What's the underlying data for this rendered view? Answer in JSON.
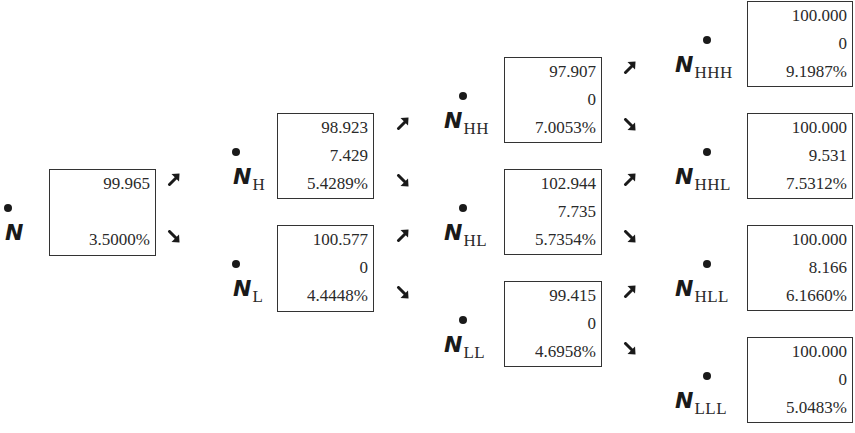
{
  "diagram": {
    "type": "binomial-tree",
    "nodes": [
      {
        "id": "N",
        "symbol": "N",
        "subscript": "",
        "lines": [
          "99.965",
          "",
          "3.5000%"
        ]
      },
      {
        "id": "NH",
        "symbol": "N",
        "subscript": "H",
        "lines": [
          "98.923",
          "7.429",
          "5.4289%"
        ]
      },
      {
        "id": "NL",
        "symbol": "N",
        "subscript": "L",
        "lines": [
          "100.577",
          "0",
          "4.4448%"
        ]
      },
      {
        "id": "NHH",
        "symbol": "N",
        "subscript": "HH",
        "lines": [
          "97.907",
          "0",
          "7.0053%"
        ]
      },
      {
        "id": "NHL",
        "symbol": "N",
        "subscript": "HL",
        "lines": [
          "102.944",
          "7.735",
          "5.7354%"
        ]
      },
      {
        "id": "NLL",
        "symbol": "N",
        "subscript": "LL",
        "lines": [
          "99.415",
          "0",
          "4.6958%"
        ]
      },
      {
        "id": "NHHH",
        "symbol": "N",
        "subscript": "HHH",
        "lines": [
          "100.000",
          "0",
          "9.1987%"
        ]
      },
      {
        "id": "NHHL",
        "symbol": "N",
        "subscript": "HHL",
        "lines": [
          "100.000",
          "9.531",
          "7.5312%"
        ]
      },
      {
        "id": "NHLL",
        "symbol": "N",
        "subscript": "HLL",
        "lines": [
          "100.000",
          "8.166",
          "6.1660%"
        ]
      },
      {
        "id": "NLLL",
        "symbol": "N",
        "subscript": "LLL",
        "lines": [
          "100.000",
          "0",
          "5.0483%"
        ]
      }
    ],
    "arrows": {
      "up": "arrow-up-right-icon",
      "down": "arrow-down-right-icon"
    }
  }
}
